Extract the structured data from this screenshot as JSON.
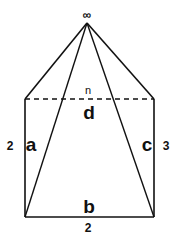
{
  "diagram": {
    "apex_symbol": "∞",
    "top_edge_label": "n",
    "top_edge_name": "d",
    "left_edge_name": "a",
    "left_edge_value": "2",
    "right_edge_name": "c",
    "right_edge_value": "3",
    "bottom_edge_name": "b",
    "bottom_edge_value": "2"
  },
  "colors": {
    "stroke": "#111111",
    "background": "#ffffff"
  }
}
